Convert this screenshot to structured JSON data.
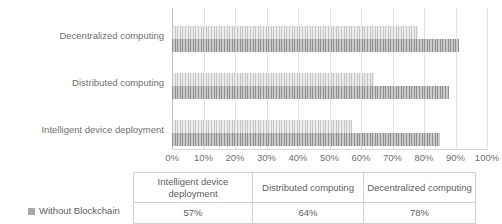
{
  "chart_data": {
    "type": "bar",
    "orientation": "horizontal",
    "categories": [
      "Decentralized computing",
      "Distributed computing",
      "Intelligent device deployment"
    ],
    "series": [
      {
        "name": "series-upper",
        "values": [
          78,
          64,
          57
        ]
      },
      {
        "name": "series-lower",
        "values": [
          91,
          88,
          85
        ]
      }
    ],
    "title": "",
    "xlabel": "",
    "ylabel": "",
    "xlim": [
      0,
      100
    ],
    "tick_labels": [
      "0%",
      "10%",
      "20%",
      "30%",
      "40%",
      "50%",
      "60%",
      "70%",
      "80%",
      "90%",
      "100%"
    ],
    "grid": true,
    "legend_position": "bottom-left"
  },
  "legend": {
    "items": [
      {
        "label": "Without Blockchain",
        "color": "#a8a8a8"
      }
    ]
  },
  "table": {
    "columns": [
      "Intelligent device deployment",
      "Distributed computing",
      "Decentralized computing"
    ],
    "rows": [
      {
        "label": "Without Blockchain",
        "values": [
          "57%",
          "64%",
          "78%"
        ]
      }
    ]
  },
  "colors": {
    "series_upper": "#dcdcdc",
    "series_lower": "#b4b4b4",
    "grid": "#e4e4e4",
    "text": "#6f6f6f"
  }
}
